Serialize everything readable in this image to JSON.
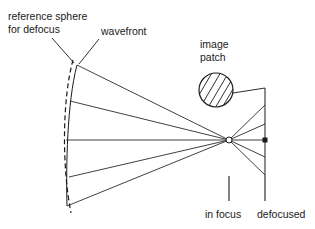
{
  "figure": {
    "background_color": "#ffffff",
    "ink_color": "#1a1a1a",
    "width": 315,
    "height": 229,
    "labels": {
      "reference_sphere_line1": "reference sphere",
      "reference_sphere_line2": "for defocus",
      "wavefront": "wavefront",
      "image_patch_line1": "image",
      "image_patch_line2": "patch",
      "in_focus": "in focus",
      "defocused": "defocused"
    },
    "geometry": {
      "focus_point": {
        "x": 229,
        "y": 140
      },
      "defocused_plane_x": 265,
      "defocused_plane_y_top": 88,
      "defocused_plane_y_bottom": 176,
      "image_patch_circle": {
        "cx": 216,
        "cy": 90,
        "r": 17
      },
      "wavefront_arc_top": {
        "x": 77,
        "y": 65
      },
      "wavefront_arc_bottom": {
        "x": 66,
        "y": 205
      },
      "reference_sphere_arc_top": {
        "x": 72,
        "y": 60
      },
      "reference_sphere_arc_bottom": {
        "x": 70,
        "y": 213
      },
      "ray_count": 5,
      "ray_left_endpoints_y": [
        65,
        101,
        140,
        177,
        205
      ],
      "ray_right_endpoints_y": [
        105,
        124,
        140,
        156,
        175
      ],
      "tick_in_focus_x": 229,
      "tick_defocused_x": 265,
      "tick_y_top": 176,
      "tick_y_bottom": 201,
      "hatch_angle_deg": 60
    }
  }
}
